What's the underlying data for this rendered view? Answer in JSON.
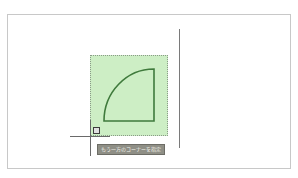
{
  "canvas": {
    "tooltip": {
      "text": "もう一方のコーナーを指定"
    },
    "colors": {
      "selection_fill": "#cdeec5",
      "shape_stroke": "#3f7a3c",
      "tooltip_bg": "#8f8f86"
    },
    "shape": {
      "type": "quarter-circle",
      "corner": [
        154,
        121
      ],
      "radius": 51
    }
  }
}
